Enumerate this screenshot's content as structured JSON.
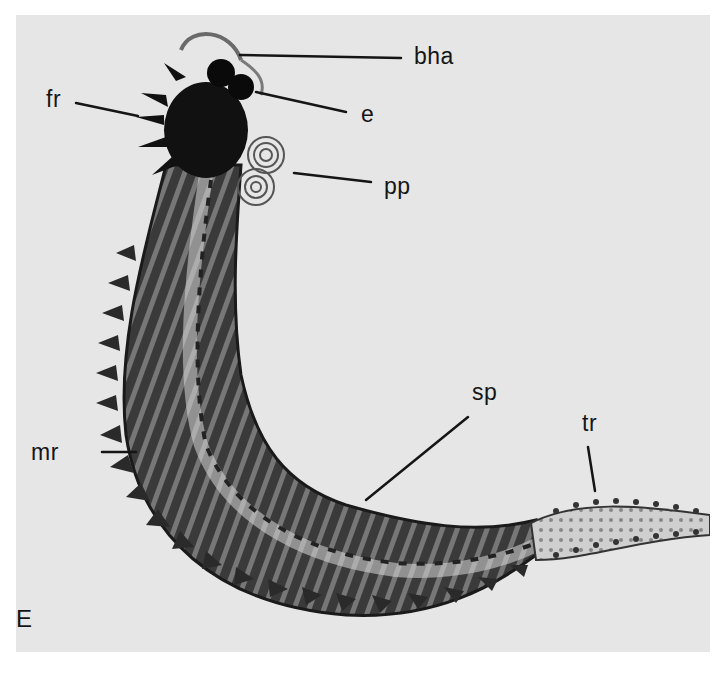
{
  "figure": {
    "panel_letter": "E",
    "background_color": "#e6e6e6",
    "labels": [
      {
        "id": "bha",
        "text": "bha"
      },
      {
        "id": "e",
        "text": "e"
      },
      {
        "id": "fr",
        "text": "fr"
      },
      {
        "id": "pp",
        "text": "pp"
      },
      {
        "id": "sp",
        "text": "sp"
      },
      {
        "id": "tr",
        "text": "tr"
      },
      {
        "id": "mr",
        "text": "mr"
      }
    ]
  }
}
